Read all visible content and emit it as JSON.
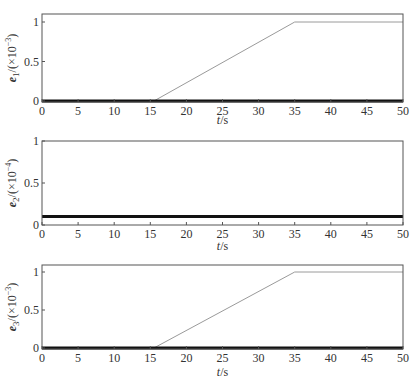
{
  "chart_data": [
    {
      "type": "line",
      "title": "",
      "xlabel": "t/s",
      "ylabel": "e1/(×10^-3)",
      "ylabel_parts": {
        "var": "e",
        "sub": "1",
        "unit": "/(×10",
        "exp": "−3",
        "close": ")"
      },
      "xlim": [
        0,
        50
      ],
      "ylim": [
        0,
        1.05
      ],
      "xticks": [
        0,
        5,
        10,
        15,
        20,
        25,
        30,
        35,
        40,
        45,
        50
      ],
      "yticks": [
        0,
        0.5,
        1
      ],
      "ytick_labels": [
        "0",
        "0.5",
        "1"
      ],
      "grid": false,
      "series": [
        {
          "name": "reference (thin)",
          "color": "#9a9a9a",
          "width": 1,
          "x": [
            0,
            15.5,
            35,
            50
          ],
          "y": [
            0,
            0,
            1,
            1
          ]
        },
        {
          "name": "actual (thick)",
          "color": "#111111",
          "width": 3,
          "x": [
            0,
            50
          ],
          "y": [
            0.0,
            0.0
          ]
        }
      ]
    },
    {
      "type": "line",
      "title": "",
      "xlabel": "t/s",
      "ylabel": "e2/(×10^-4)",
      "ylabel_parts": {
        "var": "e",
        "sub": "2",
        "unit": "/(×10",
        "exp": "−4",
        "close": ")"
      },
      "xlim": [
        0,
        50
      ],
      "ylim": [
        0,
        1
      ],
      "xticks": [
        0,
        5,
        10,
        15,
        20,
        25,
        30,
        35,
        40,
        45,
        50
      ],
      "yticks": [
        0,
        0.5,
        1
      ],
      "ytick_labels": [
        "0",
        "0.5",
        "1"
      ],
      "grid": false,
      "series": [
        {
          "name": "actual (thick)",
          "color": "#111111",
          "width": 3,
          "x": [
            0,
            50
          ],
          "y": [
            0.1,
            0.1
          ]
        }
      ]
    },
    {
      "type": "line",
      "title": "",
      "xlabel": "t/s",
      "ylabel": "e3/(×10^-3)",
      "ylabel_parts": {
        "var": "e",
        "sub": "3",
        "unit": "/(×10",
        "exp": "−3",
        "close": ")"
      },
      "xlim": [
        0,
        50
      ],
      "ylim": [
        0,
        1.1
      ],
      "xticks": [
        0,
        5,
        10,
        15,
        20,
        25,
        30,
        35,
        40,
        45,
        50
      ],
      "yticks": [
        0,
        0.5,
        1
      ],
      "ytick_labels": [
        "0",
        "0.5",
        "1"
      ],
      "grid": false,
      "series": [
        {
          "name": "reference (thin)",
          "color": "#9a9a9a",
          "width": 1,
          "x": [
            0,
            15.5,
            35,
            50
          ],
          "y": [
            0,
            0,
            1,
            1
          ]
        },
        {
          "name": "actual (thick)",
          "color": "#111111",
          "width": 3,
          "x": [
            0,
            50
          ],
          "y": [
            0.0,
            0.0
          ]
        }
      ]
    }
  ],
  "layout": {
    "plot_left": 42,
    "plot_right": 403,
    "panels": [
      {
        "top": 14,
        "bottom": 102,
        "y0_px": 101,
        "y1_px": 22,
        "xlabel_y": 124
      },
      {
        "top": 141,
        "bottom": 225,
        "y0_px": 225,
        "y1_px": 141,
        "xlabel_y": 250
      },
      {
        "top": 265,
        "bottom": 349,
        "y0_px": 348,
        "y1_px": 272,
        "xlabel_y": 376
      }
    ]
  }
}
